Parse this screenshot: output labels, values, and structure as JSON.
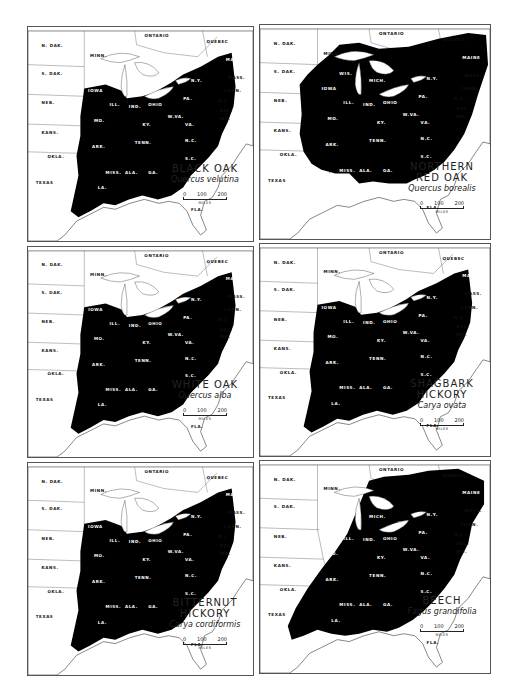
{
  "figure": {
    "panels": [
      {
        "id": "black-oak",
        "common_name": "BLACK OAK",
        "common_name_line2": "",
        "scientific_name": "Quercus velutina",
        "box": {
          "left": 27,
          "top": 26,
          "width": 227,
          "height": 216
        },
        "range": "central-east"
      },
      {
        "id": "northern-red-oak",
        "common_name": "NORTHERN",
        "common_name_line2": "RED OAK",
        "scientific_name": "Quercus borealis",
        "box": {
          "left": 259,
          "top": 24,
          "width": 232,
          "height": 216
        },
        "range": "northeast"
      },
      {
        "id": "white-oak",
        "common_name": "WHITE OAK",
        "common_name_line2": "",
        "scientific_name": "Quercus alba",
        "box": {
          "left": 27,
          "top": 246,
          "width": 227,
          "height": 212
        },
        "range": "central-east"
      },
      {
        "id": "shagbark-hickory",
        "common_name": "SHAGBARK",
        "common_name_line2": "HICKORY",
        "scientific_name": "Carya ovata",
        "box": {
          "left": 259,
          "top": 243,
          "width": 232,
          "height": 214
        },
        "range": "central-east"
      },
      {
        "id": "bitternut-hickory",
        "common_name": "BITTERNUT",
        "common_name_line2": "HICKORY",
        "scientific_name": "Carya cordiformis",
        "box": {
          "left": 27,
          "top": 462,
          "width": 227,
          "height": 214
        },
        "range": "central-east"
      },
      {
        "id": "beech",
        "common_name": "BEECH",
        "common_name_line2": "",
        "scientific_name": "Fagus grandifolia",
        "box": {
          "left": 259,
          "top": 460,
          "width": 232,
          "height": 214
        },
        "range": "east"
      }
    ],
    "scale_bar": {
      "ticks": [
        "0",
        "100",
        "200"
      ],
      "unit": "MILES"
    },
    "region_labels": {
      "canada": [
        "ONTARIO",
        "QUEBEC",
        "MAN.",
        "N.B.",
        "NOVA SCOTIA"
      ],
      "west": [
        "N. DAK.",
        "S. DAK.",
        "NEB.",
        "KANS.",
        "OKLA.",
        "TEXAS",
        "MINN."
      ],
      "central": [
        "WIS.",
        "IOWA",
        "MICH.",
        "ILL.",
        "IND.",
        "OHIO",
        "MO.",
        "KY.",
        "W.VA.",
        "VA.",
        "ARK.",
        "TENN.",
        "N.C.",
        "S.C.",
        "MISS.",
        "ALA.",
        "GA.",
        "LA.",
        "FLA."
      ],
      "northeast": [
        "PA.",
        "N.Y.",
        "VT.",
        "N.H.",
        "MAINE",
        "MASS.",
        "R.I.",
        "CONN.",
        "N.J.",
        "DEL.",
        "MD."
      ]
    }
  }
}
